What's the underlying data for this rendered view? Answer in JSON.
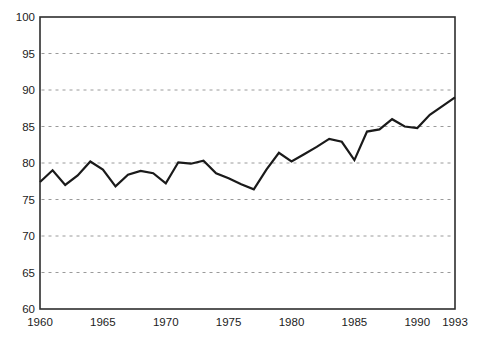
{
  "chart_data": {
    "type": "line",
    "x": [
      1960,
      1961,
      1962,
      1963,
      1964,
      1965,
      1966,
      1967,
      1968,
      1969,
      1970,
      1971,
      1972,
      1973,
      1974,
      1975,
      1976,
      1977,
      1978,
      1979,
      1980,
      1981,
      1982,
      1983,
      1984,
      1985,
      1986,
      1987,
      1988,
      1989,
      1990,
      1991,
      1992,
      1993
    ],
    "values": [
      77.4,
      79.0,
      77.0,
      78.3,
      80.2,
      79.1,
      76.8,
      78.4,
      78.9,
      78.6,
      77.2,
      80.1,
      79.9,
      80.3,
      78.6,
      77.9,
      77.1,
      76.4,
      79.1,
      81.4,
      80.2,
      81.2,
      82.2,
      83.3,
      82.9,
      80.4,
      84.3,
      84.6,
      86.0,
      85.0,
      84.8,
      86.6,
      87.8,
      89.0
    ],
    "title": "",
    "xlabel": "",
    "ylabel": "",
    "xlim": [
      1960,
      1993
    ],
    "ylim": [
      60,
      100
    ],
    "xtick_labels": [
      "1960",
      "1965",
      "1970",
      "1975",
      "1980",
      "1985",
      "1990",
      "1993"
    ],
    "xtick_values": [
      1960,
      1965,
      1970,
      1975,
      1980,
      1985,
      1990,
      1993
    ],
    "ytick_labels": [
      "60",
      "65",
      "70",
      "75",
      "80",
      "85",
      "90",
      "95",
      "100"
    ],
    "ytick_values": [
      60,
      65,
      70,
      75,
      80,
      85,
      90,
      95,
      100
    ],
    "gridline_values": [
      65,
      70,
      75,
      80,
      85,
      90,
      95
    ],
    "grid": "horizontal-dashed",
    "legend_position": "none",
    "colors": {
      "line": "#1a1a1a",
      "border": "#2e2e2e",
      "grid": "#9a9a9a",
      "label": "#1c1c1c",
      "background": "#ffffff"
    }
  }
}
